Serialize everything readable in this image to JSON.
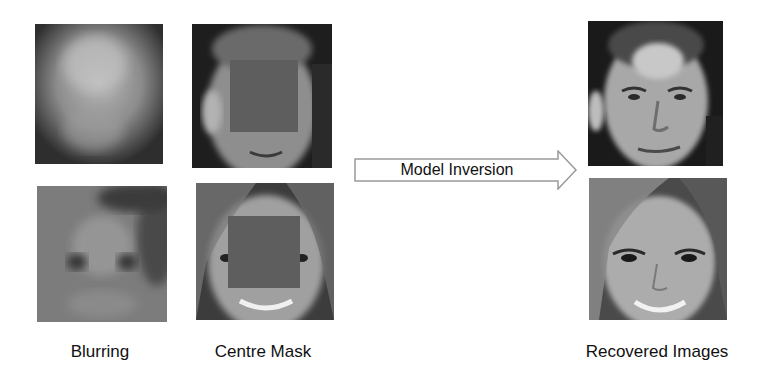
{
  "figure": {
    "columns": [
      {
        "id": "blurring",
        "label": "Blurring"
      },
      {
        "id": "centre-mask",
        "label": "Centre Mask"
      },
      {
        "id": "recovered",
        "label": "Recovered Images"
      }
    ],
    "arrow": {
      "label": "Model Inversion",
      "direction": "right",
      "icon": "right-arrow-icon"
    },
    "colors": {
      "background": "#ffffff",
      "mask_fill": "#5e5e5e",
      "arrow_stroke": "#9a9a9a",
      "text": "#111111"
    },
    "rows": [
      {
        "subject": "male face"
      },
      {
        "subject": "female face"
      }
    ]
  }
}
